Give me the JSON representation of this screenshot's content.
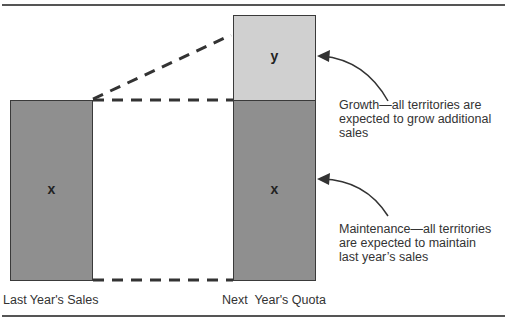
{
  "diagram": {
    "left_bar": {
      "label": "Last Year's Sales",
      "segment_label": "x",
      "color": "#8f8f8f"
    },
    "right_bar": {
      "label": "Next  Year's Quota",
      "top_segment_label": "y",
      "top_color": "#d0d0d0",
      "bottom_segment_label": "x",
      "bottom_color": "#8f8f8f"
    },
    "annotations": {
      "growth": {
        "lines": [
          "Growth—all territories are",
          "expected to grow additional",
          "sales"
        ]
      },
      "maintenance": {
        "lines": [
          "Maintenance—all territories",
          "are expected to maintain",
          "last year’s sales"
        ]
      }
    },
    "line_color": "#333333"
  }
}
